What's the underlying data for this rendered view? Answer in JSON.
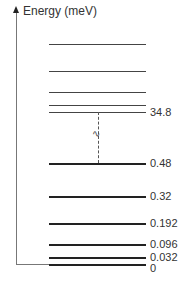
{
  "diagram": {
    "type": "energy-level-diagram",
    "axis_label": "Energy (meV)",
    "transition_symbol": "∿",
    "levels": [
      {
        "y": 44,
        "label": ""
      },
      {
        "y": 71,
        "label": ""
      },
      {
        "y": 92,
        "label": ""
      },
      {
        "y": 105,
        "label": ""
      },
      {
        "y": 112,
        "label": "34.8"
      },
      {
        "y": 163,
        "label": "0.48"
      },
      {
        "y": 196,
        "label": "0.32"
      },
      {
        "y": 223,
        "label": "0.192"
      },
      {
        "y": 244,
        "label": "0.096"
      },
      {
        "y": 257,
        "label": "0.032"
      },
      {
        "y": 264,
        "label": "0"
      }
    ]
  }
}
